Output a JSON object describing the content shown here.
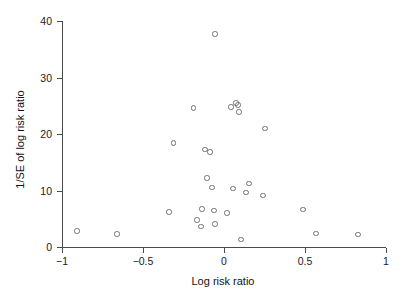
{
  "chart_data": {
    "type": "scatter",
    "title": "",
    "xlabel": "Log risk ratio",
    "ylabel": "1/SE of log risk ratio",
    "xlim": [
      -1,
      1
    ],
    "ylim": [
      0,
      40
    ],
    "xticks": [
      -1,
      -0.5,
      0,
      0.5,
      1
    ],
    "xtick_labels": [
      "−1",
      "−0.5",
      "0",
      "0.5",
      "1"
    ],
    "yticks": [
      0,
      10,
      20,
      30,
      40
    ],
    "ytick_labels": [
      "0",
      "10",
      "20",
      "30",
      "40"
    ],
    "grid": false,
    "legend": false,
    "marker": "open-circle",
    "marker_color": "#6e6e78",
    "points": [
      {
        "x": -0.056,
        "y": 37.7
      },
      {
        "x": -0.19,
        "y": 24.6
      },
      {
        "x": 0.043,
        "y": 24.8
      },
      {
        "x": 0.074,
        "y": 25.5
      },
      {
        "x": 0.086,
        "y": 25.1
      },
      {
        "x": 0.093,
        "y": 23.9
      },
      {
        "x": 0.253,
        "y": 21.0
      },
      {
        "x": -0.31,
        "y": 18.4
      },
      {
        "x": -0.117,
        "y": 17.3
      },
      {
        "x": -0.086,
        "y": 16.8
      },
      {
        "x": -0.105,
        "y": 12.2
      },
      {
        "x": -0.074,
        "y": 10.5
      },
      {
        "x": 0.055,
        "y": 10.4
      },
      {
        "x": 0.154,
        "y": 11.2
      },
      {
        "x": 0.136,
        "y": 9.6
      },
      {
        "x": 0.241,
        "y": 9.1
      },
      {
        "x": -0.34,
        "y": 6.2
      },
      {
        "x": -0.136,
        "y": 6.7
      },
      {
        "x": -0.062,
        "y": 6.5
      },
      {
        "x": 0.019,
        "y": 6.0
      },
      {
        "x": 0.488,
        "y": 6.6
      },
      {
        "x": -0.167,
        "y": 4.8
      },
      {
        "x": -0.141,
        "y": 3.6
      },
      {
        "x": -0.056,
        "y": 4.1
      },
      {
        "x": 0.105,
        "y": 1.3
      },
      {
        "x": 0.568,
        "y": 2.4
      },
      {
        "x": 0.827,
        "y": 2.2
      },
      {
        "x": -0.907,
        "y": 2.8
      },
      {
        "x": -0.66,
        "y": 2.3
      }
    ]
  }
}
